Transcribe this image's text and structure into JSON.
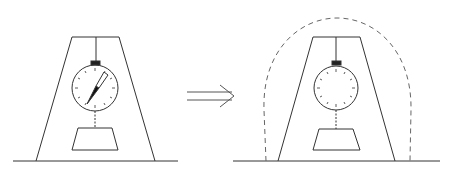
{
  "diagram": {
    "stroke_color": "#333333",
    "dash_color": "#666666",
    "left_panel": {
      "label": "scale-with-reading",
      "needle_deflected": true
    },
    "arrow": {
      "type": "double-line-implies"
    },
    "right_panel": {
      "label": "scale-enclosed-no-reading",
      "needle_deflected": false,
      "enclosure": "dashed-arch"
    }
  }
}
